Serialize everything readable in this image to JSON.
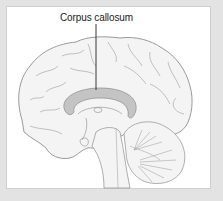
{
  "figure": {
    "type": "anatomical-illustration",
    "labels": [
      {
        "text": "Corpus callosum",
        "points_to": "corpus-callosum"
      }
    ]
  },
  "colors": {
    "frame_background": "#e3e3e3",
    "panel_background": "#ffffff",
    "brain_fill": "#f4f4f4",
    "outline": "#9a9a9a",
    "corpus_callosum": "#c4c4c4",
    "leader_line": "#222222"
  }
}
